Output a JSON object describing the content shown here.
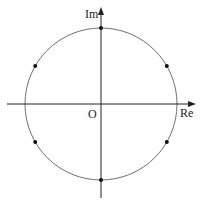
{
  "diagram": {
    "type": "complex-plane",
    "labels": {
      "imaginary_axis": "Im",
      "real_axis": "Re",
      "origin": "O"
    },
    "colors": {
      "circle": "#707070",
      "axes": "#222222",
      "points": "#111111"
    },
    "circle": {
      "center": [
        101,
        104
      ],
      "radius": 76
    },
    "points": [
      {
        "angle_deg": 90
      },
      {
        "angle_deg": 30
      },
      {
        "angle_deg": -30
      },
      {
        "angle_deg": -90
      },
      {
        "angle_deg": 150
      },
      {
        "angle_deg": 210
      }
    ]
  }
}
